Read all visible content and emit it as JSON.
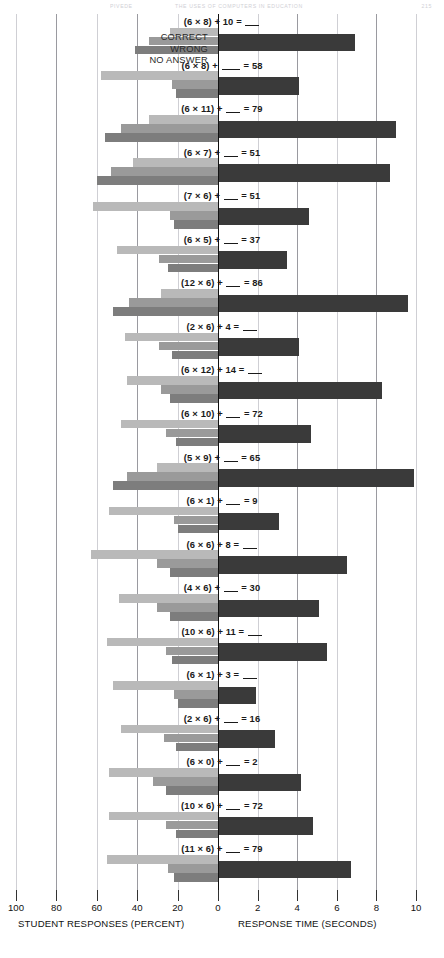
{
  "runhead": {
    "left": "PIVEDE",
    "center": "THE USES OF COMPUTERS IN EDUCATION",
    "right": "215"
  },
  "legend": {
    "items": [
      {
        "label": "CORRECT",
        "color": "#b9b9b9"
      },
      {
        "label": "WRONG",
        "color": "#9a9a9a"
      },
      {
        "label": "NO  ANSWER",
        "color": "#7d7d7d"
      }
    ]
  },
  "axes": {
    "left_title": "STUDENT RESPONSES (PERCENT)",
    "right_title": "RESPONSE TIME (SECONDS)",
    "left_ticks": [
      100,
      80,
      60,
      40,
      20,
      0
    ],
    "right_ticks": [
      0,
      2,
      4,
      6,
      8,
      10
    ]
  },
  "chart_data": {
    "type": "bar",
    "orientation": "horizontal-diverging",
    "xlabel_left": "STUDENT RESPONSES (PERCENT)",
    "xlabel_right": "RESPONSE TIME (SECONDS)",
    "left_axis_range": [
      100,
      0
    ],
    "right_axis_range": [
      0,
      10
    ],
    "left_ticks": [
      100,
      80,
      60,
      40,
      20,
      0
    ],
    "right_ticks": [
      0,
      2,
      4,
      6,
      8,
      10
    ],
    "grid": true,
    "legend": [
      "CORRECT",
      "WRONG",
      "NO ANSWER"
    ],
    "legend_position": "top-left",
    "series": [
      {
        "name": "CORRECT",
        "unit": "percent",
        "color": "#b9b9b9"
      },
      {
        "name": "WRONG",
        "unit": "percent",
        "color": "#9a9a9a"
      },
      {
        "name": "NO ANSWER",
        "unit": "percent",
        "color": "#7d7d7d"
      },
      {
        "name": "RESPONSE TIME",
        "unit": "seconds",
        "color": "#3a3a3a"
      }
    ],
    "categories": [
      "(6 × 8) + 10 = ___",
      "(6 × 8) + ____ = 58",
      "(6 × 11) + ___ = 79",
      "(6 × 7) + ___ = 51",
      "(7 × 6) + ___ = 51",
      "(6 × 5) + ___ = 37",
      "(12 × 6) + ___ = 86",
      "(2 × 6) + 4 = ___",
      "(6 × 12) + 14 = ___",
      "(6 × 10) + ___ = 72",
      "(5 × 9) + ___ = 65",
      "(6 × 1) + ___ = 9",
      "(6 × 6) + 8 = ___",
      "(4 × 6) + ___ = 30",
      "(10 × 6) + 11 = ___",
      "(6 × 1) + 3 = ___",
      "(2 × 6) + ___ = 16",
      "(6 × 0) + ___ = 2",
      "(10 × 6) + ___ = 72",
      "(11 × 6) + ___ = 79"
    ],
    "correct": [
      24,
      58,
      34,
      42,
      62,
      50,
      28,
      46,
      45,
      48,
      30,
      54,
      63,
      49,
      55,
      52,
      48,
      54,
      54,
      55
    ],
    "wrong": [
      34,
      23,
      48,
      53,
      24,
      29,
      44,
      29,
      28,
      26,
      45,
      22,
      30,
      30,
      26,
      22,
      27,
      32,
      26,
      25
    ],
    "no_answer": [
      41,
      21,
      56,
      60,
      22,
      25,
      52,
      23,
      24,
      21,
      52,
      20,
      24,
      24,
      23,
      20,
      21,
      26,
      21,
      22
    ],
    "response_time": [
      6.9,
      4.1,
      9.0,
      8.7,
      4.6,
      3.5,
      9.6,
      4.1,
      8.3,
      4.7,
      9.9,
      3.1,
      6.5,
      5.1,
      5.5,
      1.9,
      2.9,
      4.2,
      4.8,
      6.7
    ]
  }
}
